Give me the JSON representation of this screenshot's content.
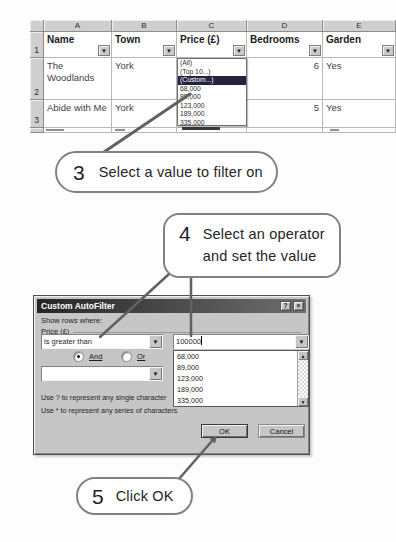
{
  "sheet": {
    "columns": [
      "A",
      "B",
      "C",
      "D",
      "E"
    ],
    "row_numbers": [
      "1",
      "2",
      "3"
    ],
    "headers": [
      "Name",
      "Town",
      "Price (£)",
      "Bedrooms",
      "Garden"
    ],
    "rows": [
      {
        "name": "The Woodlands",
        "town": "York",
        "bedrooms": "6",
        "garden": "Yes"
      },
      {
        "name": "Abide with Me",
        "town": "York",
        "bedrooms": "5",
        "garden": "Yes"
      }
    ],
    "filter_list": {
      "items": [
        "(All)",
        "(Top 10...)",
        "(Custom...)",
        "68,000",
        "89,000",
        "123,000",
        "189,000",
        "335,000"
      ],
      "selected": "(Custom...)"
    }
  },
  "callout3": {
    "number": "3",
    "label": "Select a value to filter on"
  },
  "callout4": {
    "number": "4",
    "label_line1": "Select an operator",
    "label_line2": "and set the value"
  },
  "callout5": {
    "number": "5",
    "label": "Click OK"
  },
  "dialog": {
    "title": "Custom AutoFilter",
    "help_button": "?",
    "close_button": "×",
    "show_rows_label": "Show rows where:",
    "field_label": "Price (£)",
    "operator1": "is greater than",
    "value1": "100000",
    "and_label": "And",
    "or_label": "Or",
    "value_list": [
      "68,000",
      "89,000",
      "123,000",
      "189,000",
      "335,000"
    ],
    "hint1": "Use ? to represent any single character",
    "hint2": "Use * to represent any series of characters",
    "ok_label": "OK",
    "cancel_label": "Cancel"
  },
  "colors": {
    "selected_item_bg": "#23233c",
    "titlebar_gradient_start": "#262626",
    "titlebar_gradient_end": "#6e6e6e",
    "dialog_bg": "#c6c6c6",
    "callout_border": "#828282",
    "connector_line": "#616161",
    "header_gray": "#cfcfcf"
  }
}
